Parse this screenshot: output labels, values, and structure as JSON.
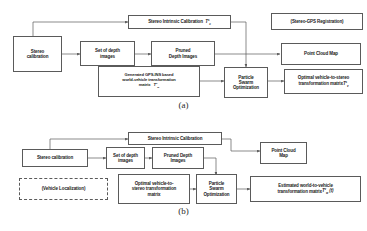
{
  "figure": {
    "panels": [
      {
        "id": "a",
        "caption": "(a)",
        "nodes": {
          "stereo_intrinsic": "Stereo Intrinsic Calibration",
          "stereo_intrinsic_symbol": "T",
          "stereo_intrinsic_sup": "s",
          "stereo_intrinsic_sub": "c",
          "stereo_gps_registration": "(Stereo-GPS Registration)",
          "stereo_calibration": "Stereo\ncalibration",
          "set_of_depth_images": "Set of depth\nimages",
          "pruned_depth_images": "Pruned\nDepth Images",
          "point_cloud_map": "Point Cloud Map",
          "generated_gps_ins": "Generated GPS-INS based\nworld-vehicle transformation\nmatrix",
          "generated_gps_ins_symbol": "T",
          "generated_gps_ins_sup": "v",
          "generated_gps_ins_sub": "w",
          "particle_swarm": "Particle\nSwarm\nOptimization",
          "optimal_transform": "Optimal vehicle-to-stereo\ntransformation matrix",
          "optimal_transform_symbol": "T",
          "optimal_transform_sup": "s",
          "optimal_transform_sub": "v"
        }
      },
      {
        "id": "b",
        "caption": "(b)",
        "nodes": {
          "stereo_intrinsic": "Stereo Intrinsic Calibration",
          "vehicle_localization": "(Vehicle Localization)",
          "stereo_calibration": "Stereo calibration",
          "set_of_depth_images": "Set of depth\nimages",
          "pruned_depth_images": "Pruned Depth\nImages",
          "point_cloud_map": "Point Cloud\nMap",
          "optimal_transform": "Optimal vehicle-to-\nstereo transformation\nmatrix",
          "particle_swarm": "Particle\nSwarm\nOptimization",
          "estimated_transform": "Estimated world-to-vehicle\ntransformation matrix",
          "estimated_transform_symbol": "T",
          "estimated_transform_sup": "v",
          "estimated_transform_sub": "w",
          "estimated_transform_arg": "(t)"
        }
      }
    ],
    "colors": {
      "stroke": "#5a5a5a",
      "background": "#ffffff",
      "text": "#1a1a1a"
    }
  }
}
